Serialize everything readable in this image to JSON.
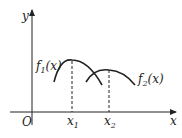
{
  "diagram": {
    "axes": {
      "x_label": "x",
      "y_label": "y",
      "origin_label": "O"
    },
    "curves": [
      {
        "name": "f1",
        "label": "f",
        "sub": "1",
        "arg": "(x)"
      },
      {
        "name": "f2",
        "label": "f",
        "sub": "2",
        "arg": "(x)"
      }
    ],
    "points": [
      {
        "label": "x",
        "sub": "1"
      },
      {
        "label": "x",
        "sub": "2"
      }
    ],
    "colors": {
      "stroke": "#222222"
    }
  }
}
